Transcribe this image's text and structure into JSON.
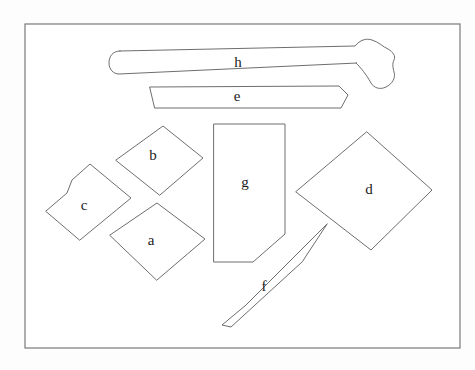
{
  "figure": {
    "background_color": "#fdfdfd",
    "stroke_color": "#6e6e6e",
    "fill_color": "#ffffff",
    "label_color": "#1b1b1b",
    "frame": {
      "name": "border-frame",
      "x": 25,
      "y": 24,
      "width": 435,
      "height": 324,
      "stroke_color": "#7a7a7a"
    },
    "shapes": [
      {
        "id": "a",
        "label": "a",
        "description": "diamond / rhombus outline, lower-left group",
        "label_x": 151,
        "label_y": 242,
        "points": "110,235 157,203 205,239 157,280"
      },
      {
        "id": "b",
        "label": "b",
        "description": "diamond / rhombus outline, upper-left group",
        "label_x": 153,
        "label_y": 157,
        "points": "116,160 163,126 203,158 160,195"
      },
      {
        "id": "c",
        "label": "c",
        "description": "quadrilateral with notched upper-left edge",
        "label_x": 84,
        "label_y": 207,
        "points": "46,211 67,193 72,180 90,164 131,198 80,240"
      },
      {
        "id": "d",
        "label": "d",
        "description": "large diamond / rhombus outline, right side",
        "label_x": 369,
        "label_y": 191,
        "points": "367,132 432,190 371,250 296,192"
      },
      {
        "id": "e",
        "label": "e",
        "description": "long slender bar with slanted left end and chamfered right tip",
        "label_x": 237,
        "label_y": 98,
        "points": "150,87 339,86 348,95 341,108 155,108"
      },
      {
        "id": "f",
        "label": "f",
        "description": "long tapered wedge / chisel pointing up-right",
        "label_x": 264,
        "label_y": 288,
        "points": "327,224 246,305 222,325 231,327 302,262"
      },
      {
        "id": "g",
        "label": "g",
        "description": "tall rectangle with chamfered bottom-right corner",
        "label_x": 245,
        "label_y": 184,
        "points": "214,124 285,124 285,234 253,262 214,262"
      },
      {
        "id": "h",
        "label": "h",
        "description": "hammer: long handle with flared curved head at right end",
        "label_x": 238,
        "label_y": 64,
        "path": "M 120,51 L 355,46 C 360,40 366,38 372,40 C 379,42 383,47 388,49 C 393,52 396,56 394,60 C 392,64 393,68 394,72 C 396,78 392,84 386,87 C 380,90 374,88 371,83 C 366,74 361,68 356,63 L 357,63 L 119,74 C 113,74 109,69 109,63 C 109,56 113,51 120,51 Z"
      }
    ]
  }
}
